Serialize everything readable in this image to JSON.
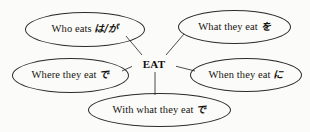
{
  "diagram": {
    "type": "mind-map",
    "center": {
      "label": "EAT"
    },
    "nodes": [
      {
        "id": "who-eats",
        "english": "Who eats",
        "particle": "は/が",
        "position": "top-left"
      },
      {
        "id": "what-they-eat",
        "english": "What they eat",
        "particle": "を",
        "position": "top-right"
      },
      {
        "id": "where-they-eat",
        "english": "Where they eat",
        "particle": "で",
        "position": "middle-left"
      },
      {
        "id": "when-they-eat",
        "english": "When they eat",
        "particle": "に",
        "position": "middle-right"
      },
      {
        "id": "with-what-they-eat",
        "english": "With what they eat",
        "particle": "で",
        "position": "bottom"
      }
    ],
    "colors": {
      "background": "#fbfbf9",
      "stroke": "#2e2c2a",
      "text": "#16140f"
    }
  }
}
